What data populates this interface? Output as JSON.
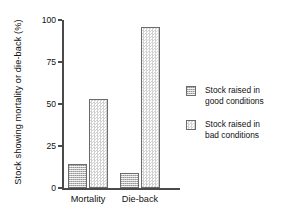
{
  "chart_data": {
    "type": "bar",
    "title": "",
    "xlabel": "",
    "ylabel": "Stock showing mortality or die-back (%)",
    "categories": [
      "Mortality",
      "Die-back"
    ],
    "series": [
      {
        "name": "Stock raised in good conditions",
        "name_line1": "Stock raised in",
        "name_line2": "good conditions",
        "values": [
          14,
          9
        ],
        "swatch": "dark-dotted"
      },
      {
        "name": "Stock raised in bad conditions",
        "name_line1": "Stock raised in",
        "name_line2": "bad conditions",
        "values": [
          53,
          96
        ],
        "swatch": "light-checkered"
      }
    ],
    "ylim": [
      0,
      100
    ],
    "yticks": [
      0,
      25,
      50,
      75,
      100
    ],
    "ytick_labels": [
      "0",
      "25",
      "50",
      "75",
      "100"
    ],
    "grid": false,
    "legend_position": "right",
    "axis_color": "#4a4a4a",
    "bar_edge_color": "#6b6b6b",
    "text_color": "#111111",
    "background": "#ffffff"
  }
}
